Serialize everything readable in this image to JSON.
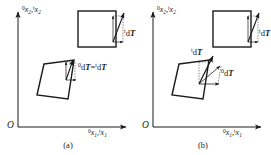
{
  "figure": {
    "type": "technical-diagram",
    "background_color": "#ffffff",
    "line_color": "#1a1a1a",
    "panels": [
      {
        "id": "a",
        "caption": "(a)",
        "axes": {
          "origin_label": "O",
          "y_axis": {
            "pre_left": "0",
            "var": "x",
            "sub": "2",
            "sep": ",",
            "pre_right": "t",
            "var2": "x",
            "sub2": "2"
          },
          "x_axis": {
            "pre_left": "0",
            "var": "x",
            "sub": "1",
            "sep": ",",
            "pre_right": "t",
            "var2": "x",
            "sub2": "1"
          }
        },
        "shapes": [
          {
            "name": "undeformed-square",
            "kind": "square"
          },
          {
            "name": "deformed-parallelogram",
            "kind": "parallelogram"
          }
        ],
        "annotations": [
          {
            "name": "square-dt-label",
            "pre": "t",
            "d": "d",
            "t": "T",
            "equals": "",
            "pre2": "",
            "d2": "",
            "t2": ""
          },
          {
            "name": "parallelogram-dt-label",
            "pre": "0",
            "d": "d",
            "t": "T",
            "equals": "=",
            "pre2": "t",
            "d2": "d",
            "t2": "T"
          }
        ]
      },
      {
        "id": "b",
        "caption": "(b)",
        "axes": {
          "origin_label": "O",
          "y_axis": {
            "pre_left": "0",
            "var": "x",
            "sub": "2",
            "sep": ",",
            "pre_right": "t",
            "var2": "x",
            "sub2": "2"
          },
          "x_axis": {
            "pre_left": "0",
            "var": "x",
            "sub": "1",
            "sep": ",",
            "pre_right": "t",
            "var2": "x",
            "sub2": "1"
          }
        },
        "shapes": [
          {
            "name": "undeformed-square",
            "kind": "square"
          },
          {
            "name": "deformed-parallelogram",
            "kind": "parallelogram"
          }
        ],
        "annotations": [
          {
            "name": "square-dt-label",
            "pre": "t",
            "d": "d",
            "t": "T",
            "equals": "",
            "pre2": "",
            "d2": "",
            "t2": ""
          },
          {
            "name": "parallelogram-dt-upper-label",
            "pre": "t",
            "d": "d",
            "t": "T",
            "equals": "",
            "pre2": "",
            "d2": "",
            "t2": ""
          },
          {
            "name": "parallelogram-dt-lower-label",
            "pre": "0",
            "d": "d",
            "t": "T",
            "equals": "",
            "pre2": "",
            "d2": "",
            "t2": ""
          }
        ]
      }
    ]
  }
}
